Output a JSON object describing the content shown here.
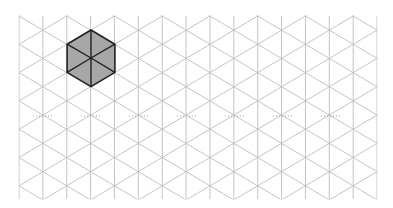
{
  "diagram": {
    "type": "isometric-triangular-grid",
    "background": "#ffffff",
    "grid": {
      "origin_x": 19,
      "origin_y": 16,
      "right_x": 377,
      "bottom_y": 199,
      "columns": 16,
      "column_spacing": 23.87,
      "row_spacing": 28.3,
      "line_color": "#c4c4c4"
    },
    "dotted_guide": {
      "y": 116,
      "color": "#a0a0a0",
      "segment_centers_x": [
        43,
        91,
        139,
        187,
        235,
        283,
        331
      ],
      "half_length": 10
    },
    "highlighted_shape": {
      "name": "hexagon",
      "triangles": 6,
      "fill": "#a7a7a7",
      "stroke": "#222222",
      "center": [
        91,
        58
      ],
      "vertices": [
        [
          91,
          30
        ],
        [
          114.9,
          44.2
        ],
        [
          114.9,
          72.4
        ],
        [
          91,
          86.6
        ],
        [
          67.1,
          72.4
        ],
        [
          67.1,
          44.2
        ]
      ]
    }
  }
}
